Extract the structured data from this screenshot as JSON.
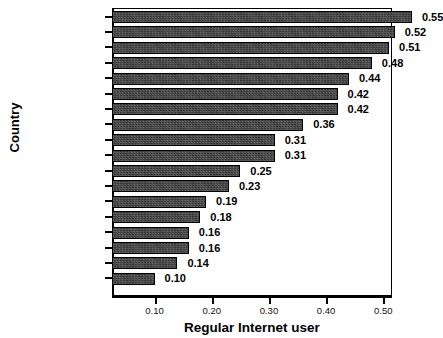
{
  "chart_data": {
    "type": "bar",
    "orientation": "horizontal",
    "title": "",
    "xlabel": "Regular Internet user",
    "ylabel": "Country",
    "categories": [
      "Denmark",
      "Sweden",
      "Norway",
      "Switzerland",
      "Netherlands",
      "Luxembourg",
      "Finland",
      "United Kingdom",
      "Ireland",
      "Israel",
      "Slovenia",
      "Italy",
      "Czech Republic",
      "Portugal",
      "Spain",
      "Poland",
      "Hungary",
      "Greece"
    ],
    "values": [
      0.55,
      0.52,
      0.51,
      0.48,
      0.44,
      0.42,
      0.42,
      0.36,
      0.31,
      0.31,
      0.25,
      0.23,
      0.19,
      0.18,
      0.16,
      0.16,
      0.14,
      0.1
    ],
    "value_labels": [
      "0.55",
      "0.52",
      "0.51",
      "0.48",
      "0.44",
      "0.42",
      "0.42",
      "0.36",
      "0.31",
      "0.31",
      "0.25",
      "0.23",
      "0.19",
      "0.18",
      "0.16",
      "0.16",
      "0.14",
      "0.10"
    ],
    "xticks": [
      0.1,
      0.2,
      0.3,
      0.4,
      0.5
    ],
    "xtick_labels": [
      "0.10",
      "0.20",
      "0.30",
      "0.40",
      "0.50"
    ],
    "xlim": [
      0.0256,
      0.5152
    ],
    "grid": false,
    "legend": null,
    "bar_color": "#3b3b3b",
    "bar_edge_color": "#000000",
    "text_color": "#000000",
    "background": "#ffffff"
  }
}
